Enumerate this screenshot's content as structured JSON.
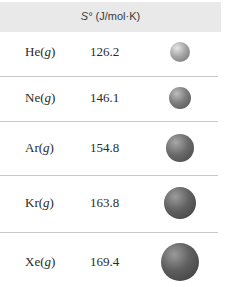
{
  "table": {
    "header": {
      "symbol": "S°",
      "units": " (J/mol·K)"
    },
    "rows": [
      {
        "element": "He",
        "state": "g",
        "entropy": "126.2",
        "sphere": {
          "cx": 180,
          "cy": 52,
          "r": 10,
          "color": "#9a9a9a"
        }
      },
      {
        "element": "Ne",
        "state": "g",
        "entropy": "146.1",
        "sphere": {
          "cx": 180,
          "cy": 98,
          "r": 11,
          "color": "#787878"
        }
      },
      {
        "element": "Ar",
        "state": "g",
        "entropy": "154.8",
        "sphere": {
          "cx": 180,
          "cy": 148,
          "r": 14,
          "color": "#686868"
        }
      },
      {
        "element": "Kr",
        "state": "g",
        "entropy": "163.8",
        "sphere": {
          "cx": 180,
          "cy": 203,
          "r": 16,
          "color": "#606060"
        }
      },
      {
        "element": "Xe",
        "state": "g",
        "entropy": "169.4",
        "sphere": {
          "cx": 180,
          "cy": 262,
          "r": 19,
          "color": "#5c5c5c"
        }
      }
    ]
  }
}
